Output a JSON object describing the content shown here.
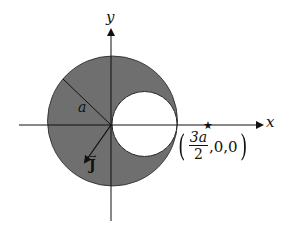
{
  "figure": {
    "type": "geometry-diagram",
    "colors": {
      "shaded_region": "#6f6f6f",
      "hole": "#ffffff",
      "lines": "#111111",
      "background": "#ffffff"
    },
    "geometry": {
      "origin_px": [
        111,
        125
      ],
      "big_circle": {
        "cx": 112.5,
        "cy": 121,
        "r": 65
      },
      "small_circle": {
        "cx": 144.5,
        "cy": 124,
        "r": 32.5
      },
      "star_px": [
        208,
        124
      ]
    }
  },
  "labels": {
    "x_axis": "x",
    "y_axis": "y",
    "radius": "a",
    "current_density": "J",
    "current_density_vec": "→",
    "point": {
      "open": "(",
      "numerator": "3a",
      "denominator": "2",
      "rest": ",0,0",
      "close": ")"
    }
  },
  "markers": {
    "field_point": "★"
  }
}
